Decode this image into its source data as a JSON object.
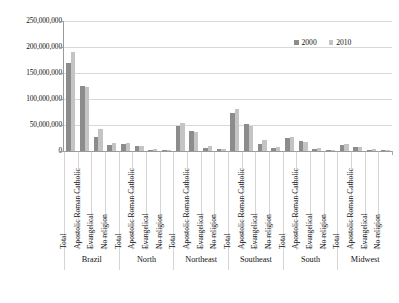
{
  "chart_data": {
    "type": "bar",
    "title": "",
    "subtitle": "",
    "xlabel": "",
    "ylabel": "",
    "ylim": [
      0,
      250000000
    ],
    "grid": true,
    "legend_position": "top-right",
    "ytick_labels": [
      "250,000,000",
      "200,000,000",
      "150,000,000",
      "100,000,000",
      "50,000,000",
      "0"
    ],
    "ytick_values": [
      250000000,
      200000000,
      150000000,
      100000000,
      50000000,
      0
    ],
    "categories": [
      "Total",
      "Apostolic Roman Catholic",
      "Evangelical",
      "No religion"
    ],
    "group_labels": [
      "Brazil",
      "North",
      "Northeast",
      "Southeast",
      "South",
      "Midwest"
    ],
    "series": [
      {
        "name": "2000",
        "color": "#8c8c8c"
      },
      {
        "name": "2010",
        "color": "#c4c4c4"
      }
    ],
    "groups": [
      {
        "label": "Brazil",
        "bars": [
          {
            "category": "Total",
            "values": [
              169800000,
              190750000
            ]
          },
          {
            "category": "Apostolic Roman Catholic",
            "values": [
              124980000,
              123280000
            ]
          },
          {
            "category": "Evangelical",
            "values": [
              26180000,
              42280000
            ]
          },
          {
            "category": "No religion",
            "values": [
              12490000,
              15330000
            ]
          }
        ]
      },
      {
        "label": "North",
        "bars": [
          {
            "category": "Total",
            "values": [
              12900000,
              15860000
            ]
          },
          {
            "category": "Apostolic Roman Catholic",
            "values": [
              9180000,
              9310000
            ]
          },
          {
            "category": "Evangelical",
            "values": [
              2310000,
              4220000
            ]
          },
          {
            "category": "No religion",
            "values": [
              950000,
              1460000
            ]
          }
        ]
      },
      {
        "label": "Northeast",
        "bars": [
          {
            "category": "Total",
            "values": [
              47740000,
              53080000
            ]
          },
          {
            "category": "Apostolic Roman Catholic",
            "values": [
              37700000,
              36100000
            ]
          },
          {
            "category": "Evangelical",
            "values": [
              5220000,
              9660000
            ]
          },
          {
            "category": "No religion",
            "values": [
              3180000,
              4270000
            ]
          }
        ]
      },
      {
        "label": "Southeast",
        "bars": [
          {
            "category": "Total",
            "values": [
              72410000,
              80360000
            ]
          },
          {
            "category": "Apostolic Roman Catholic",
            "values": [
              52880000,
              47390000
            ]
          },
          {
            "category": "Evangelical",
            "values": [
              12830000,
              20810000
            ]
          },
          {
            "category": "No religion",
            "values": [
              5770000,
              7230000
            ]
          }
        ]
      },
      {
        "label": "South",
        "bars": [
          {
            "category": "Total",
            "values": [
              25110000,
              27390000
            ]
          },
          {
            "category": "Apostolic Roman Catholic",
            "values": [
              19100000,
              18250000
            ]
          },
          {
            "category": "Evangelical",
            "values": [
              3650000,
              5100000
            ]
          },
          {
            "category": "No religion",
            "values": [
              1400000,
              1410000
            ]
          }
        ]
      },
      {
        "label": "Midwest",
        "bars": [
          {
            "category": "Total",
            "values": [
              11640000,
              14060000
            ]
          },
          {
            "category": "Apostolic Roman Catholic",
            "values": [
              8090000,
              8230000
            ]
          },
          {
            "category": "Evangelical",
            "values": [
              2180000,
              3480000
            ]
          },
          {
            "category": "No religion",
            "values": [
              780000,
              960000
            ]
          }
        ]
      }
    ]
  },
  "legend": {
    "items": [
      {
        "label": "2000"
      },
      {
        "label": "2010"
      }
    ]
  },
  "colors": {
    "series_2000": "#8c8c8c",
    "series_2010": "#c4c4c4",
    "gridline": "#d8d8d8",
    "axis": "#9a9a9a",
    "text": "#121212",
    "background": "#ffffff"
  }
}
